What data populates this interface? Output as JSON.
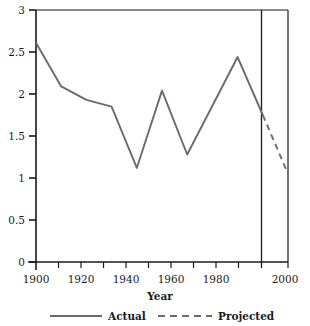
{
  "chart_data": {
    "type": "line",
    "title": "",
    "xlabel": "Year",
    "ylabel": "",
    "xlim": [
      1900,
      2000
    ],
    "ylim": [
      0,
      3
    ],
    "grid": false,
    "legend_position": "bottom",
    "x_ticks": [
      1900,
      1910,
      1920,
      1930,
      1940,
      1950,
      1960,
      1970,
      1980,
      1990,
      2000
    ],
    "x_tick_labels": [
      "1900",
      "",
      "1920",
      "",
      "1940",
      "",
      "1960",
      "",
      "1980",
      "",
      "2000"
    ],
    "y_ticks": [
      0,
      0.5,
      1,
      1.5,
      2,
      2.5,
      3
    ],
    "y_tick_labels": [
      "0",
      "0.5",
      "1",
      "1.5",
      "2",
      "2.5",
      "3"
    ],
    "divider_x": 1990,
    "series": [
      {
        "name": "Actual",
        "style": "solid",
        "color": "#6b6b6b",
        "x": [
          1900,
          1910,
          1920,
          1930,
          1940,
          1950,
          1960,
          1980,
          1990
        ],
        "values": [
          2.61,
          2.09,
          1.93,
          1.85,
          1.12,
          2.04,
          1.28,
          2.44,
          1.75
        ]
      },
      {
        "name": "Projected",
        "style": "dashed",
        "color": "#6b6b6b",
        "x": [
          1990,
          2000
        ],
        "values": [
          1.75,
          1.05
        ]
      }
    ]
  },
  "axis": {
    "x_title": "Year",
    "tick_labels_x": [
      "1900",
      "1920",
      "1940",
      "1960",
      "1980",
      "2000"
    ],
    "tick_labels_y": [
      "0",
      "0.5",
      "1",
      "1.5",
      "2",
      "2.5",
      "3"
    ]
  },
  "legend": {
    "items": [
      {
        "label": "Actual",
        "style": "solid"
      },
      {
        "label": "Projected",
        "style": "dashed"
      }
    ]
  },
  "colors": {
    "line": "#6b6b6b",
    "axis": "#1a1a1a",
    "background": "#ffffff"
  }
}
